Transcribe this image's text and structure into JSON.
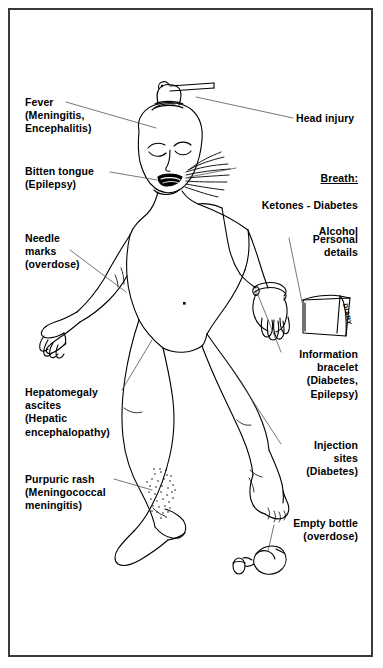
{
  "document": {
    "kind": "medical-illustration",
    "subject": "Signs to look for in the unconscious patient",
    "frame_color": "#3a3a3a",
    "ink_color": "#000000",
    "background_color": "#ffffff"
  },
  "labels": {
    "fever": "Fever\n(Meningitis,\nEncephalitis)",
    "bitten_tongue": "Bitten tongue\n(Epilepsy)",
    "needle_marks": "Needle\nmarks\n(overdose)",
    "hepatomegaly": "Hepatomegaly\nascites\n(Hepatic\nencephalopathy)",
    "purpuric_rash": "Purpuric rash\n(Meningococcal\nmeningitis)",
    "head_injury": "Head injury",
    "breath_heading": "Breath:",
    "breath_line2": "Ketones - Diabetes",
    "breath_line3": "Alcohol",
    "personal_details": "Personal\ndetails",
    "information_bracelet": "Information\nbracelet\n(Diabetes,\nEpilepsy)",
    "injection_sites": "Injection\nsites\n(Diabetes)",
    "empty_bottle": "Empty bottle\n(overdose)"
  },
  "figure": {
    "diary_text": "DIARY",
    "parts": [
      "head",
      "face",
      "closed-eyes",
      "nose",
      "open-mouth-with-bitten-tongue",
      "head-wound-with-bar",
      "breath-lines",
      "neck",
      "torso",
      "navel",
      "left-arm",
      "left-hand",
      "right-arm",
      "right-hand",
      "wrist-bracelet",
      "left-leg",
      "right-leg",
      "left-foot",
      "right-foot",
      "purpuric-rash-stipple",
      "needle-marks",
      "injection-sites"
    ]
  },
  "callouts": [
    {
      "name": "fever",
      "from": "label",
      "to": "forehead"
    },
    {
      "name": "head-injury",
      "from": "label",
      "to": "head-wound"
    },
    {
      "name": "bitten-tongue",
      "from": "label",
      "to": "mouth"
    },
    {
      "name": "breath",
      "from": "label",
      "to": "mouth-breath-lines"
    },
    {
      "name": "needle-marks",
      "from": "label",
      "to": "left-antecubital-fossa"
    },
    {
      "name": "personal-details",
      "from": "label",
      "to": "diary-book"
    },
    {
      "name": "information-bracelet",
      "from": "label",
      "to": "wrist-bracelet"
    },
    {
      "name": "hepatomegaly",
      "from": "label",
      "to": "abdomen"
    },
    {
      "name": "injection-sites",
      "from": "label",
      "to": "thigh"
    },
    {
      "name": "purpuric-rash",
      "from": "label",
      "to": "shin-stipple"
    },
    {
      "name": "empty-bottle",
      "from": "label",
      "to": "pill-bottle"
    }
  ]
}
